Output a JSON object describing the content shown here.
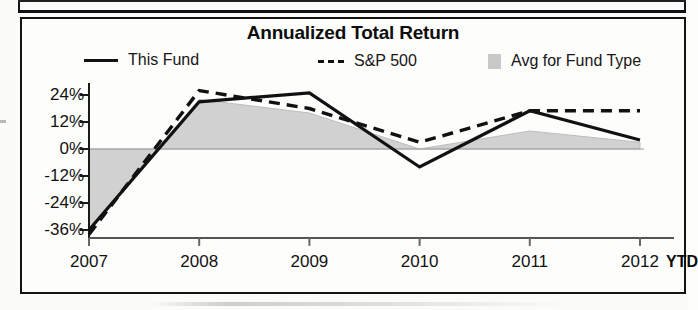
{
  "chart": {
    "title": "Annualized Total Return",
    "ytd_label": "YTD"
  },
  "legend": {
    "items": [
      {
        "label": "This Fund",
        "marker": "solid-line-swatch"
      },
      {
        "label": "S&P 500",
        "marker": "dashed-line-swatch"
      },
      {
        "label": "Avg for Fund Type",
        "marker": "gray-square-swatch"
      }
    ]
  },
  "axes": {
    "y_ticks": [
      "24%",
      "12%",
      "0%",
      "-12%",
      "-24%",
      "-36%"
    ],
    "x_ticks": [
      "2007",
      "2008",
      "2009",
      "2010",
      "2011",
      "2012"
    ]
  },
  "chart_data": {
    "type": "line",
    "title": "Annualized Total Return",
    "xlabel": "",
    "ylabel": "",
    "categories": [
      "2007",
      "2008",
      "2009",
      "2010",
      "2011",
      "2012"
    ],
    "ylim": [
      -40,
      30
    ],
    "y_tick_values": [
      24,
      12,
      0,
      -12,
      -24,
      -36
    ],
    "grid": false,
    "zero_line": true,
    "legend_position": "top",
    "series": [
      {
        "name": "This Fund",
        "style": "solid",
        "color": "#111111",
        "values": [
          -36,
          21,
          25,
          -8,
          17,
          4
        ]
      },
      {
        "name": "S&P 500",
        "style": "dashed",
        "color": "#111111",
        "values": [
          -38,
          26,
          18,
          3,
          17,
          17
        ]
      },
      {
        "name": "Avg for Fund Type",
        "style": "area",
        "color": "#c9c9c9",
        "values": [
          -35,
          22,
          16,
          0,
          8,
          3
        ]
      }
    ],
    "annotations": [
      {
        "text": "YTD",
        "position": "after-2012-x-tick",
        "bold": true
      }
    ]
  },
  "colors": {
    "ink": "#111111",
    "area_fill": "#c9c9c9",
    "page": "#fdfdfb"
  }
}
